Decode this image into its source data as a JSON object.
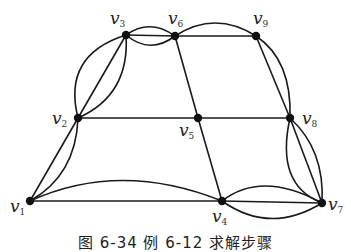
{
  "diagram": {
    "type": "multigraph",
    "nodes": [
      {
        "id": "v1",
        "label": "v",
        "sub": "1",
        "x": 30,
        "y": 201,
        "lx": 10,
        "ly": 212
      },
      {
        "id": "v2",
        "label": "v",
        "sub": "2",
        "x": 78,
        "y": 118,
        "lx": 52,
        "ly": 124
      },
      {
        "id": "v3",
        "label": "v",
        "sub": "3",
        "x": 126,
        "y": 35,
        "lx": 110,
        "ly": 24
      },
      {
        "id": "v4",
        "label": "v",
        "sub": "4",
        "x": 222,
        "y": 201,
        "lx": 212,
        "ly": 222
      },
      {
        "id": "v5",
        "label": "v",
        "sub": "5",
        "x": 198,
        "y": 118,
        "lx": 179,
        "ly": 136
      },
      {
        "id": "v6",
        "label": "v",
        "sub": "6",
        "x": 175,
        "y": 36,
        "lx": 168,
        "ly": 24
      },
      {
        "id": "v7",
        "label": "v",
        "sub": "7",
        "x": 322,
        "y": 203,
        "lx": 328,
        "ly": 210
      },
      {
        "id": "v8",
        "label": "v",
        "sub": "8",
        "x": 290,
        "y": 118,
        "lx": 302,
        "ly": 124
      },
      {
        "id": "v9",
        "label": "v",
        "sub": "9",
        "x": 256,
        "y": 36,
        "lx": 253,
        "ly": 24
      }
    ],
    "edges": [
      {
        "from": "v1",
        "to": "v2",
        "path": "M30,201 L78,118"
      },
      {
        "from": "v1",
        "to": "v2",
        "path": "M30,201 Q76,175 78,118"
      },
      {
        "from": "v1",
        "to": "v4",
        "path": "M30,201 L222,201"
      },
      {
        "from": "v1",
        "to": "v4",
        "path": "M30,201 Q120,160 222,201"
      },
      {
        "from": "v2",
        "to": "v3",
        "path": "M78,118 L126,35"
      },
      {
        "from": "v2",
        "to": "v3",
        "path": "M78,118 Q62,55 126,35"
      },
      {
        "from": "v2",
        "to": "v3",
        "path": "M78,118 Q130,95 126,35"
      },
      {
        "from": "v2",
        "to": "v5",
        "path": "M78,118 L198,118"
      },
      {
        "from": "v3",
        "to": "v6",
        "path": "M126,35 L175,36"
      },
      {
        "from": "v3",
        "to": "v6",
        "path": "M126,35 Q150,18 175,36"
      },
      {
        "from": "v3",
        "to": "v6",
        "path": "M126,35 Q150,55 175,36"
      },
      {
        "from": "v6",
        "to": "v9",
        "path": "M175,36 L256,36"
      },
      {
        "from": "v6",
        "to": "v9",
        "path": "M175,36 Q215,10 256,36"
      },
      {
        "from": "v6",
        "to": "v5",
        "path": "M175,36 L198,118"
      },
      {
        "from": "v5",
        "to": "v8",
        "path": "M198,118 L290,118"
      },
      {
        "from": "v5",
        "to": "v4",
        "path": "M198,118 L222,201"
      },
      {
        "from": "v9",
        "to": "v8",
        "path": "M256,36 L290,118"
      },
      {
        "from": "v9",
        "to": "v8",
        "path": "M256,36 Q292,60 290,118"
      },
      {
        "from": "v4",
        "to": "v7",
        "path": "M222,201 L322,203"
      },
      {
        "from": "v4",
        "to": "v7",
        "path": "M222,201 Q262,170 322,203"
      },
      {
        "from": "v4",
        "to": "v7",
        "path": "M222,201 Q270,235 322,203"
      },
      {
        "from": "v8",
        "to": "v7",
        "path": "M290,118 L322,203"
      },
      {
        "from": "v8",
        "to": "v7",
        "path": "M290,118 Q275,185 322,203"
      },
      {
        "from": "v8",
        "to": "v7",
        "path": "M290,118 Q325,150 322,203"
      }
    ]
  },
  "caption": "图 6-34  例 6-12 求解步骤"
}
